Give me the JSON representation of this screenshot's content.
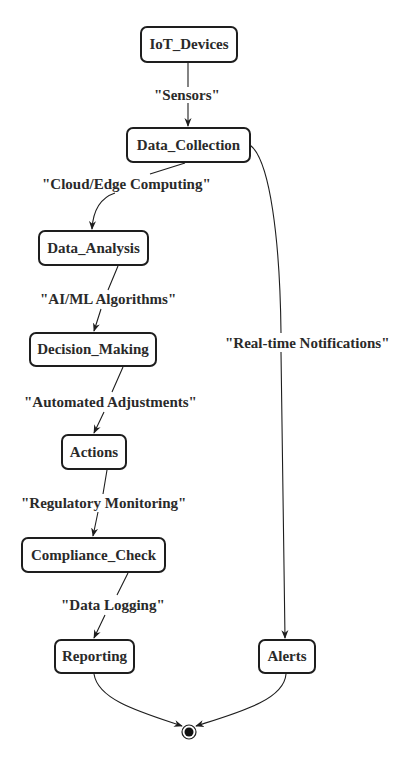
{
  "diagram": {
    "type": "state-diagram",
    "nodes": {
      "iot_devices": "IoT_Devices",
      "data_collection": "Data_Collection",
      "data_analysis": "Data_Analysis",
      "decision_making": "Decision_Making",
      "actions": "Actions",
      "compliance_check": "Compliance_Check",
      "reporting": "Reporting",
      "alerts": "Alerts"
    },
    "edges": [
      {
        "from": "IoT_Devices",
        "to": "Data_Collection",
        "label": "\"Sensors\""
      },
      {
        "from": "Data_Collection",
        "to": "Data_Analysis",
        "label": "\"Cloud/Edge Computing\""
      },
      {
        "from": "Data_Analysis",
        "to": "Decision_Making",
        "label": "\"AI/ML Algorithms\""
      },
      {
        "from": "Decision_Making",
        "to": "Actions",
        "label": "\"Automated Adjustments\""
      },
      {
        "from": "Actions",
        "to": "Compliance_Check",
        "label": "\"Regulatory Monitoring\""
      },
      {
        "from": "Compliance_Check",
        "to": "Reporting",
        "label": "\"Data Logging\""
      },
      {
        "from": "Data_Collection",
        "to": "Alerts",
        "label": "\"Real-time Notifications\""
      },
      {
        "from": "Reporting",
        "to": "[*]",
        "label": ""
      },
      {
        "from": "Alerts",
        "to": "[*]",
        "label": ""
      }
    ],
    "end_state": "final-state",
    "colors": {
      "stroke": "#1e1e1e",
      "text": "#2a2a2a",
      "background": "#ffffff"
    }
  }
}
